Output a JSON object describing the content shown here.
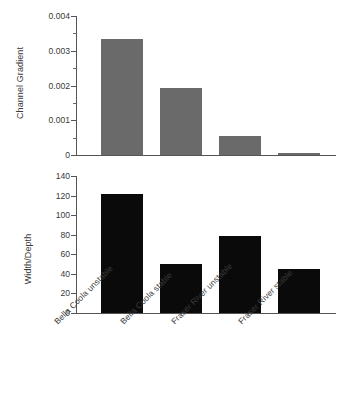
{
  "chart_data": [
    {
      "type": "bar",
      "title": "",
      "xlabel": "",
      "ylabel": "Channel Gradient",
      "categories": [
        "Bella Coola unstable",
        "Bella Coola stable",
        "Fraser River unstable",
        "Fraser River stable"
      ],
      "values": [
        0.00333,
        0.00192,
        0.00055,
        7e-05
      ],
      "ylim": [
        0,
        0.004
      ],
      "yticks": [
        0,
        0.001,
        0.002,
        0.003,
        0.004
      ],
      "ytick_labels": [
        "0",
        "0.001",
        "0.002",
        "0.003",
        "0.004"
      ],
      "yminor_ticks": [
        0.0005,
        0.0015,
        0.0025,
        0.0035
      ],
      "grid": false,
      "legend": "none",
      "bar_color": "#6a6a6a"
    },
    {
      "type": "bar",
      "title": "",
      "xlabel": "",
      "ylabel": "Width/Depth",
      "categories": [
        "Bella Coola unstable",
        "Bella Coola stable",
        "Fraser River unstable",
        "Fraser River stable"
      ],
      "values": [
        122,
        50,
        79,
        45
      ],
      "ylim": [
        0,
        140
      ],
      "yticks": [
        0,
        20,
        40,
        60,
        80,
        100,
        120,
        140
      ],
      "ytick_labels": [
        "0",
        "20",
        "40",
        "60",
        "80",
        "100",
        "120",
        "140"
      ],
      "yminor_ticks": [],
      "grid": false,
      "legend": "none",
      "bar_color": "#0a0a0a"
    }
  ],
  "axis_color": "#555555",
  "background": "#ffffff"
}
